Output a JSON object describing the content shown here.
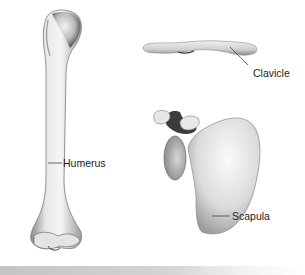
{
  "figure": {
    "labels": {
      "humerus": "Humerus",
      "clavicle": "Clavicle",
      "scapula": "Scapula"
    },
    "colors": {
      "bone_light": "#f2f2f2",
      "bone_mid": "#c8c8c8",
      "bone_dark": "#6a6a6a",
      "leader_line": "#444444",
      "footer_bar": "#c4c4c4"
    }
  }
}
